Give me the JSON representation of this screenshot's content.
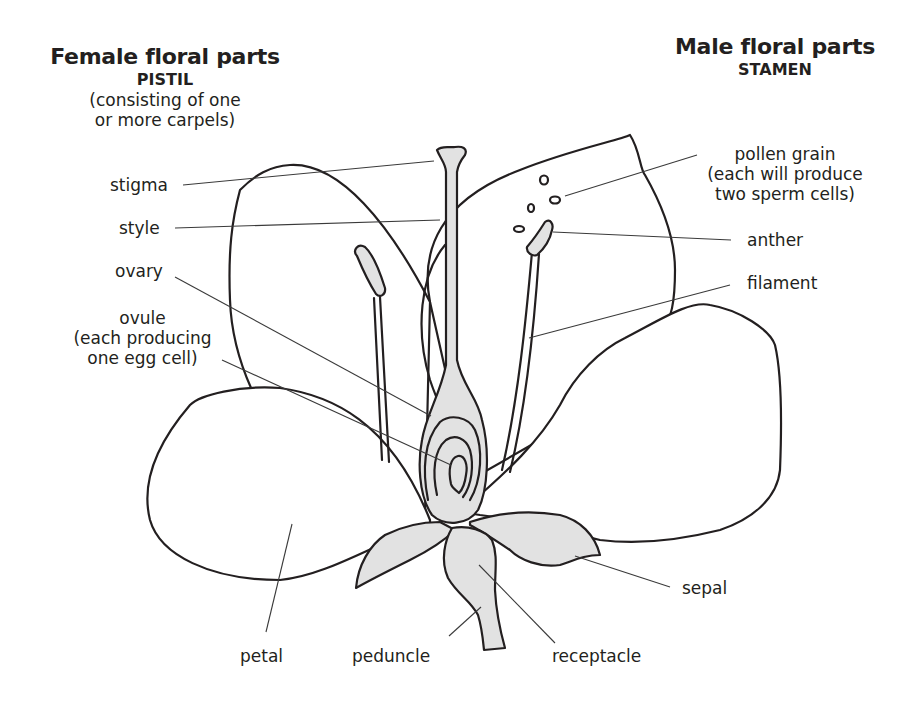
{
  "female": {
    "title": "Female floral parts",
    "subtitle": "PISTIL",
    "note_line1": "(consisting of one",
    "note_line2": "or more carpels)"
  },
  "male": {
    "title": "Male floral parts",
    "subtitle": "STAMEN"
  },
  "labels": {
    "stigma": "stigma",
    "style": "style",
    "ovary": "ovary",
    "ovule_line1": "ovule",
    "ovule_line2": "(each producing",
    "ovule_line3": "one egg cell)",
    "pollen_line1": "pollen grain",
    "pollen_line2": "(each will produce",
    "pollen_line3": "two sperm cells)",
    "anther": "anther",
    "filament": "filament",
    "sepal": "sepal",
    "petal": "petal",
    "peduncle": "peduncle",
    "receptacle": "receptacle"
  },
  "colors": {
    "ink": "#231f20",
    "shading": "#e2e2e2",
    "background": "#ffffff"
  }
}
